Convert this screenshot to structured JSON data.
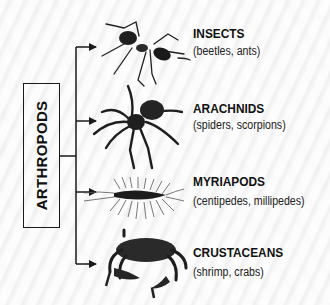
{
  "diagram": {
    "root": {
      "label": "ARTHROPODS"
    },
    "branches": [
      {
        "title": "INSECTS",
        "examples": "(beetles, ants)",
        "illustration": "ant-icon"
      },
      {
        "title": "ARACHNIDS",
        "examples": "(spiders, scorpions)",
        "illustration": "spider-icon"
      },
      {
        "title": "MYRIAPODS",
        "examples": "(centipedes, millipedes)",
        "illustration": "centipede-icon"
      },
      {
        "title": "CRUSTACEANS",
        "examples": "(shrimp, crabs)",
        "illustration": "crab-icon"
      }
    ],
    "colors": {
      "line": "#1a1a1a",
      "text": "#111111",
      "background": "#f6f6f6"
    }
  }
}
